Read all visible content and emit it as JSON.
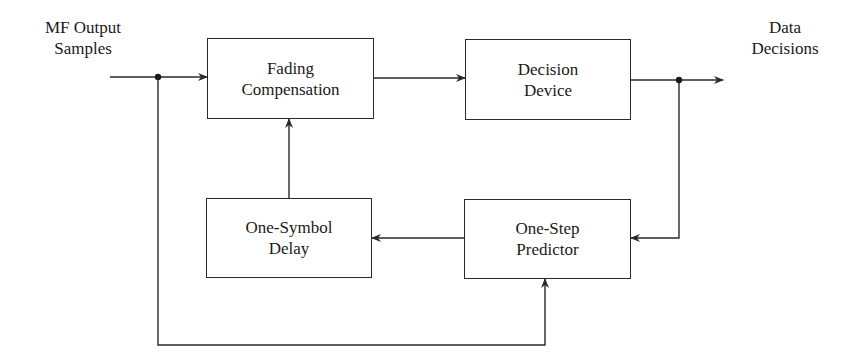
{
  "diagram": {
    "type": "block-diagram",
    "input_label": {
      "line1": "MF Output",
      "line2": "Samples"
    },
    "output_label": {
      "line1": "Data",
      "line2": "Decisions"
    },
    "blocks": [
      {
        "id": "fading",
        "line1": "Fading",
        "line2": "Compensation"
      },
      {
        "id": "decision",
        "line1": "Decision",
        "line2": "Device"
      },
      {
        "id": "delay",
        "line1": "One-Symbol",
        "line2": "Delay"
      },
      {
        "id": "predictor",
        "line1": "One-Step",
        "line2": "Predictor"
      }
    ],
    "connections": [
      {
        "from": "input",
        "to": "fading"
      },
      {
        "from": "fading",
        "to": "decision"
      },
      {
        "from": "decision",
        "to": "output"
      },
      {
        "from": "decision-output-junction",
        "to": "predictor"
      },
      {
        "from": "predictor",
        "to": "delay"
      },
      {
        "from": "delay",
        "to": "fading"
      },
      {
        "from": "input-junction",
        "to": "predictor"
      }
    ],
    "line_color": "#2a2a2a"
  }
}
